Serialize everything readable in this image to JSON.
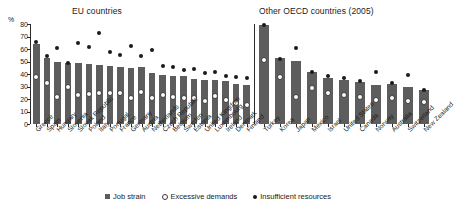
{
  "titles": {
    "eu": "EU countries",
    "oecd": "Other OECD countries (2005)"
  },
  "axis": {
    "unit": "%",
    "y_ticks": [
      "0",
      "10",
      "20",
      "30",
      "40",
      "50",
      "60",
      "70",
      "80"
    ]
  },
  "legend": {
    "job_strain": "Job strain",
    "excessive_demands": "Excessive demands",
    "insufficient_resources": "Insufficient resources"
  },
  "chart_data": {
    "type": "bar",
    "xlabel": "",
    "ylabel": "%",
    "ylim": [
      0,
      80
    ],
    "grid": false,
    "legend_position": "bottom",
    "panels": [
      {
        "name": "EU countries",
        "categories": [
          "Greece",
          "Spain",
          "Hungary",
          "Slovenia",
          "Slovak Republic",
          "Poland",
          "Italy",
          "Portugal",
          "France",
          "Germany",
          "Austria",
          "Netherlands",
          "Czech Republic",
          "Belgium",
          "Sweden",
          "Estonia",
          "United Kingdom",
          "Luxembourg",
          "Ireland",
          "Denmark",
          "Finland"
        ],
        "series": [
          {
            "name": "Job strain",
            "type": "bar",
            "values": [
              64,
              53,
              50,
              49,
              48.5,
              48,
              47.5,
              46.5,
              45.5,
              45,
              45.5,
              41,
              39.5,
              38.5,
              38.5,
              36,
              35.5,
              35.5,
              34.5,
              32,
              31
            ]
          },
          {
            "name": "Excessive demands",
            "type": "marker-open",
            "values": [
              38,
              33,
              22,
              29.5,
              23.5,
              24,
              25,
              24.5,
              24.5,
              20.5,
              25.5,
              20.5,
              23,
              21.5,
              20.5,
              20.5,
              18.5,
              22.5,
              19.5,
              17,
              15.5
            ]
          },
          {
            "name": "Insufficient resources",
            "type": "marker-filled",
            "values": [
              66,
              54.5,
              61,
              49,
              65,
              61.5,
              73,
              57.5,
              55.5,
              62.5,
              54.5,
              59.5,
              46.5,
              45.5,
              43.5,
              44,
              40.5,
              42,
              38.5,
              38,
              36.5
            ]
          }
        ]
      },
      {
        "name": "Other OECD countries (2005)",
        "categories": [
          "Turkey",
          "Korea",
          "Japan",
          "Mexico",
          "Israel",
          "United States",
          "Canada",
          "Norway",
          "Australia",
          "Switzerland",
          "New Zealand"
        ],
        "series": [
          {
            "name": "Job strain",
            "type": "bar",
            "values": [
              79,
              52.5,
              50.5,
              42,
              37,
              35.5,
              34,
              31,
              32,
              30,
              27
            ]
          },
          {
            "name": "Excessive demands",
            "type": "marker-open",
            "values": [
              51.5,
              37.5,
              21.5,
              29,
              24.5,
              23.5,
              21.5,
              19,
              20.5,
              18.5,
              17.5
            ]
          },
          {
            "name": "Insufficient resources",
            "type": "marker-filled",
            "values": [
              79.5,
              52,
              60.5,
              41.5,
              38.5,
              36.5,
              34.5,
              41.5,
              32.5,
              39.5,
              27.5
            ]
          }
        ]
      }
    ]
  }
}
